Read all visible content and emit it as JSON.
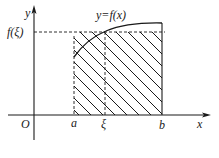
{
  "diagram": {
    "curve_label": "y=f(x)",
    "axis_labels": {
      "x": "x",
      "y": "y",
      "origin": "O"
    },
    "x_ticks": [
      {
        "name": "a",
        "label": "a"
      },
      {
        "name": "xi",
        "label": "ξ"
      },
      {
        "name": "b",
        "label": "b"
      }
    ],
    "y_ticks": [
      {
        "name": "f-xi",
        "label": "f(ξ)"
      }
    ],
    "colors": {
      "ink": "#1a1a1a",
      "background": "#ffffff"
    },
    "elements": [
      "x-axis with arrow",
      "y-axis with arrow",
      "curve y=f(x) from a to b",
      "hatched rectangle [a,b] × [0,f(ξ)]",
      "dashed horizontal line at f(ξ)",
      "dashed vertical lines at a and ξ",
      "solid vertical line at b"
    ]
  }
}
